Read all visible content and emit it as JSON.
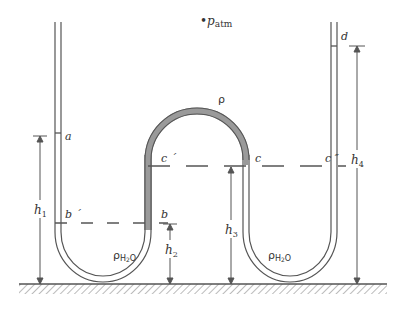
{
  "diagram": {
    "atm_label": {
      "prefix": "•",
      "main": "p",
      "sub": "atm"
    },
    "fluid_top_label": "ρ",
    "fluid_water_label": {
      "main": "ρ",
      "sub": "H",
      "sub2": "2",
      "tail": "O"
    },
    "points": {
      "a": "a",
      "b_prime": "b ´",
      "b": "b",
      "c_prime": "c ´",
      "c": "c",
      "c_double_prime": "c ″",
      "d": "d"
    },
    "heights": {
      "h1": {
        "main": "h",
        "sub": "1"
      },
      "h2": {
        "main": "h",
        "sub": "2"
      },
      "h3": {
        "main": "h",
        "sub": "3"
      },
      "h4": {
        "main": "h",
        "sub": "4"
      }
    },
    "colors": {
      "line": "#555555",
      "dense_fluid": "#9a9a9a",
      "background": "#ffffff"
    }
  }
}
